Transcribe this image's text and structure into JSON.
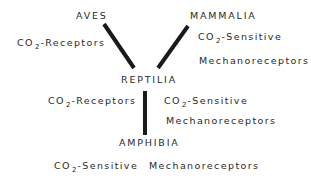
{
  "diagram": {
    "nodes": {
      "aves": "AVES",
      "mammalia": "MAMMALIA",
      "reptilia": "REPTILIA",
      "amphibia": "AMPHIBIA"
    },
    "labels": {
      "aves_receptor": {
        "pre": "CO",
        "sub": "2",
        "post": "-Receptors"
      },
      "mammalia_receptor": {
        "pre": "CO",
        "sub": "2",
        "post": "-Sensitive",
        "line2": "Mechanoreceptors"
      },
      "reptilia_left": {
        "pre": "CO",
        "sub": "2",
        "post": "-Receptors"
      },
      "reptilia_right": {
        "pre": "CO",
        "sub": "2",
        "post": "-Sensitive",
        "line2": "Mechanoreceptors"
      },
      "amphibia_receptor": {
        "pre": "CO",
        "sub": "2",
        "post": "-Sensitive",
        "tail": "Mechanoreceptors"
      }
    },
    "edges": [
      {
        "from": "aves",
        "to": "reptilia"
      },
      {
        "from": "mammalia",
        "to": "reptilia"
      },
      {
        "from": "reptilia",
        "to": "amphibia"
      }
    ],
    "line_color": "#1a1a1a"
  }
}
